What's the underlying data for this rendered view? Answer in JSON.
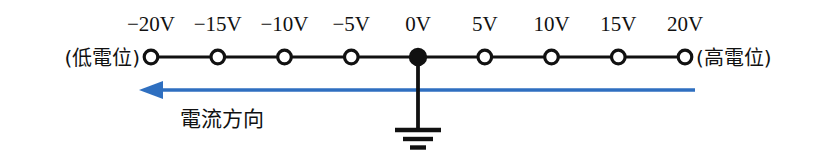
{
  "figure": {
    "type": "circuit-potential-diagram",
    "background_color": "#ffffff",
    "line_color": "#111111",
    "arrow_color": "#2f6fc0"
  },
  "axis": {
    "start_x": 151,
    "end_x": 685,
    "y": 57,
    "node_spacing": 66.75,
    "node_radius_open": 7,
    "node_radius_filled": 7.5
  },
  "potential_labels": [
    "−20V",
    "−15V",
    "−10V",
    "−5V",
    "0V",
    "5V",
    "10V",
    "15V",
    "20V"
  ],
  "potential_values": [
    -20,
    -15,
    -10,
    -5,
    0,
    5,
    10,
    15,
    20
  ],
  "potential_unit": "V",
  "nodes": [
    {
      "label": "−20V",
      "value": -20,
      "filled": false,
      "grounded": false
    },
    {
      "label": "−15V",
      "value": -15,
      "filled": false,
      "grounded": false
    },
    {
      "label": "−10V",
      "value": -10,
      "filled": false,
      "grounded": false
    },
    {
      "label": "−5V",
      "value": -5,
      "filled": false,
      "grounded": false
    },
    {
      "label": "0V",
      "value": 0,
      "filled": true,
      "grounded": true
    },
    {
      "label": "5V",
      "value": 5,
      "filled": false,
      "grounded": false
    },
    {
      "label": "10V",
      "value": 10,
      "filled": false,
      "grounded": false
    },
    {
      "label": "15V",
      "value": 15,
      "filled": false,
      "grounded": false
    },
    {
      "label": "20V",
      "value": 20,
      "filled": false,
      "grounded": false
    }
  ],
  "end_labels": {
    "left": "(低電位)",
    "right": "(高電位)"
  },
  "current_arrow": {
    "label": "電流方向",
    "direction": "left",
    "color": "#2f6fc0",
    "tip_x": 140,
    "tail_x": 695,
    "y": 90,
    "label_x": 222,
    "label_y": 126
  },
  "ground_symbol": {
    "name": "earth-ground",
    "stem_x": 418,
    "stem_top_y": 57,
    "stem_bottom_y": 129,
    "bars": [
      {
        "half_width": 23,
        "y": 130,
        "thickness": 4
      },
      {
        "half_width": 15,
        "y": 139,
        "thickness": 4
      },
      {
        "half_width": 8,
        "y": 147,
        "thickness": 4
      }
    ]
  }
}
